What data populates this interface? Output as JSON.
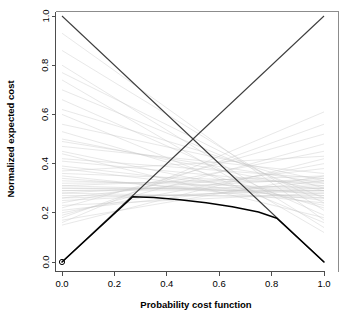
{
  "chart_data": {
    "type": "line",
    "title": "",
    "xlabel": "Probability cost function",
    "ylabel": "Normalized expected cost",
    "xlim": [
      0.0,
      1.0
    ],
    "ylim": [
      0.0,
      1.0
    ],
    "grid": false,
    "legend_position": "none",
    "xticks": [
      "0.0",
      "0.2",
      "0.4",
      "0.6",
      "0.8",
      "1.0"
    ],
    "xtick_values": [
      0.0,
      0.2,
      0.4,
      0.6,
      0.8,
      1.0
    ],
    "yticks": [
      "0.0",
      "0.2",
      "0.4",
      "0.6",
      "0.8",
      "1.0"
    ],
    "ytick_values": [
      0.0,
      0.2,
      0.4,
      0.6,
      0.8,
      1.0
    ],
    "series": [
      {
        "name": "trivial-classifier-always-negative",
        "style": "solid-dark-diagonal",
        "color": "#3c3c3c",
        "x": [
          0.0,
          1.0
        ],
        "values": [
          1.0,
          0.0
        ]
      },
      {
        "name": "trivial-classifier-always-positive",
        "style": "solid-dark-diagonal",
        "color": "#3c3c3c",
        "x": [
          0.0,
          1.0
        ],
        "values": [
          0.0,
          1.0
        ]
      },
      {
        "name": "lower-envelope-cost-curve",
        "style": "solid-black-thick",
        "color": "#000000",
        "x": [
          0.0,
          0.27,
          0.35,
          0.45,
          0.55,
          0.65,
          0.75,
          0.82,
          1.0
        ],
        "values": [
          0.0,
          0.265,
          0.262,
          0.253,
          0.241,
          0.225,
          0.203,
          0.178,
          0.0
        ]
      },
      {
        "name": "classifier-cost-lines-bundle",
        "style": "faint-gray-lines",
        "color": "#c8c8c8",
        "description": "Bundle of individual classifier cost lines, each running from its false-positive rate at PCF=0 to its false-negative rate at PCF=1",
        "endpoints": [
          [
            0.93,
            0.17
          ],
          [
            0.86,
            0.21
          ],
          [
            0.8,
            0.14
          ],
          [
            0.77,
            0.24
          ],
          [
            0.74,
            0.12
          ],
          [
            0.7,
            0.26
          ],
          [
            0.66,
            0.19
          ],
          [
            0.62,
            0.3
          ],
          [
            0.6,
            0.16
          ],
          [
            0.56,
            0.33
          ],
          [
            0.53,
            0.22
          ],
          [
            0.5,
            0.29
          ],
          [
            0.47,
            0.36
          ],
          [
            0.44,
            0.18
          ],
          [
            0.41,
            0.31
          ],
          [
            0.39,
            0.27
          ],
          [
            0.37,
            0.43
          ],
          [
            0.35,
            0.24
          ],
          [
            0.33,
            0.3
          ],
          [
            0.31,
            0.35
          ],
          [
            0.3,
            0.29
          ],
          [
            0.3,
            0.3
          ],
          [
            0.29,
            0.31
          ],
          [
            0.29,
            0.29
          ],
          [
            0.28,
            0.34
          ],
          [
            0.27,
            0.27
          ],
          [
            0.26,
            0.38
          ],
          [
            0.25,
            0.3
          ],
          [
            0.24,
            0.45
          ],
          [
            0.23,
            0.28
          ],
          [
            0.22,
            0.52
          ],
          [
            0.21,
            0.33
          ],
          [
            0.2,
            0.4
          ],
          [
            0.19,
            0.48
          ],
          [
            0.18,
            0.56
          ],
          [
            0.17,
            0.35
          ],
          [
            0.16,
            0.61
          ],
          [
            0.15,
            0.42
          ],
          [
            0.28,
            0.26
          ],
          [
            0.31,
            0.28
          ],
          [
            0.26,
            0.29
          ],
          [
            0.32,
            0.33
          ],
          [
            0.34,
            0.26
          ],
          [
            0.36,
            0.32
          ],
          [
            0.38,
            0.25
          ],
          [
            0.42,
            0.34
          ],
          [
            0.45,
            0.23
          ],
          [
            0.49,
            0.32
          ]
        ]
      }
    ],
    "markers": [
      {
        "name": "origin-point",
        "x": 0.0,
        "y": 0.0,
        "shape": "circle"
      }
    ]
  },
  "axes": {
    "x_title": "Probability cost function",
    "y_title": "Normalized expected cost"
  }
}
